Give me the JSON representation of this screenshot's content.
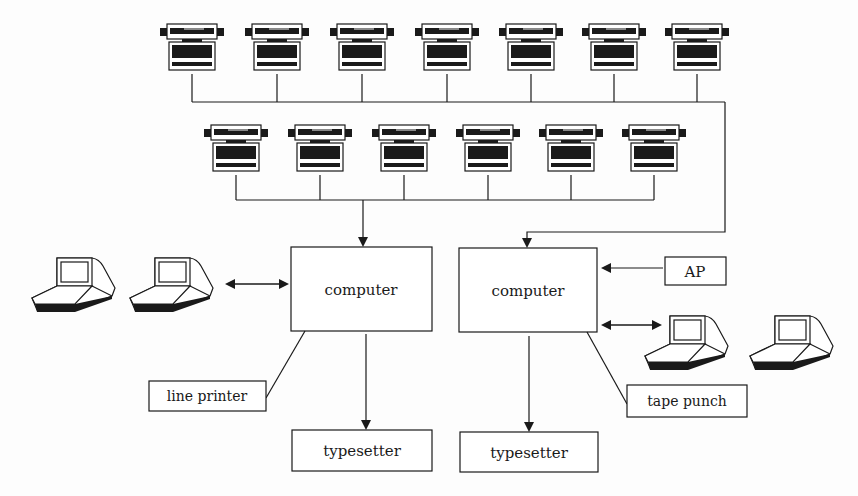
{
  "diagram": {
    "title": "",
    "nodes": {
      "computer_left": {
        "label": "computer"
      },
      "computer_right": {
        "label": "computer"
      },
      "line_printer": {
        "label": "line printer"
      },
      "typesetter_left": {
        "label": "typesetter"
      },
      "typesetter_right": {
        "label": "typesetter"
      },
      "ap": {
        "label": "AP"
      },
      "tape_punch": {
        "label": "tape punch"
      }
    },
    "typewriter_terminals": {
      "top_row_count": 7,
      "second_row_count": 6
    },
    "video_terminals": {
      "left_group_count": 2,
      "right_group_count": 2
    },
    "connections": [
      {
        "from": "top_row_typewriters",
        "to": "computer_right",
        "type": "arrow"
      },
      {
        "from": "second_row_typewriters",
        "to": "computer_left",
        "type": "arrow"
      },
      {
        "from": "left_video_terminals",
        "to": "computer_left",
        "type": "bidirectional"
      },
      {
        "from": "ap",
        "to": "computer_right",
        "type": "arrow"
      },
      {
        "from": "computer_right",
        "to": "right_video_terminals",
        "type": "bidirectional"
      },
      {
        "from": "computer_left",
        "to": "line_printer",
        "type": "line"
      },
      {
        "from": "computer_left",
        "to": "typesetter_left",
        "type": "arrow"
      },
      {
        "from": "computer_right",
        "to": "tape_punch",
        "type": "line"
      },
      {
        "from": "computer_right",
        "to": "typesetter_right",
        "type": "arrow"
      }
    ],
    "colors": {
      "ink": "#1a1a1a",
      "background": "#fdfdfd"
    }
  }
}
